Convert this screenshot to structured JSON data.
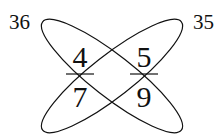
{
  "diagram": {
    "fractions": [
      {
        "numerator": "4",
        "denominator": "7"
      },
      {
        "numerator": "5",
        "denominator": "9"
      }
    ],
    "products": {
      "left": "36",
      "right": "35"
    },
    "colors": {
      "stroke": "#111111",
      "background": "#ffffff"
    }
  }
}
